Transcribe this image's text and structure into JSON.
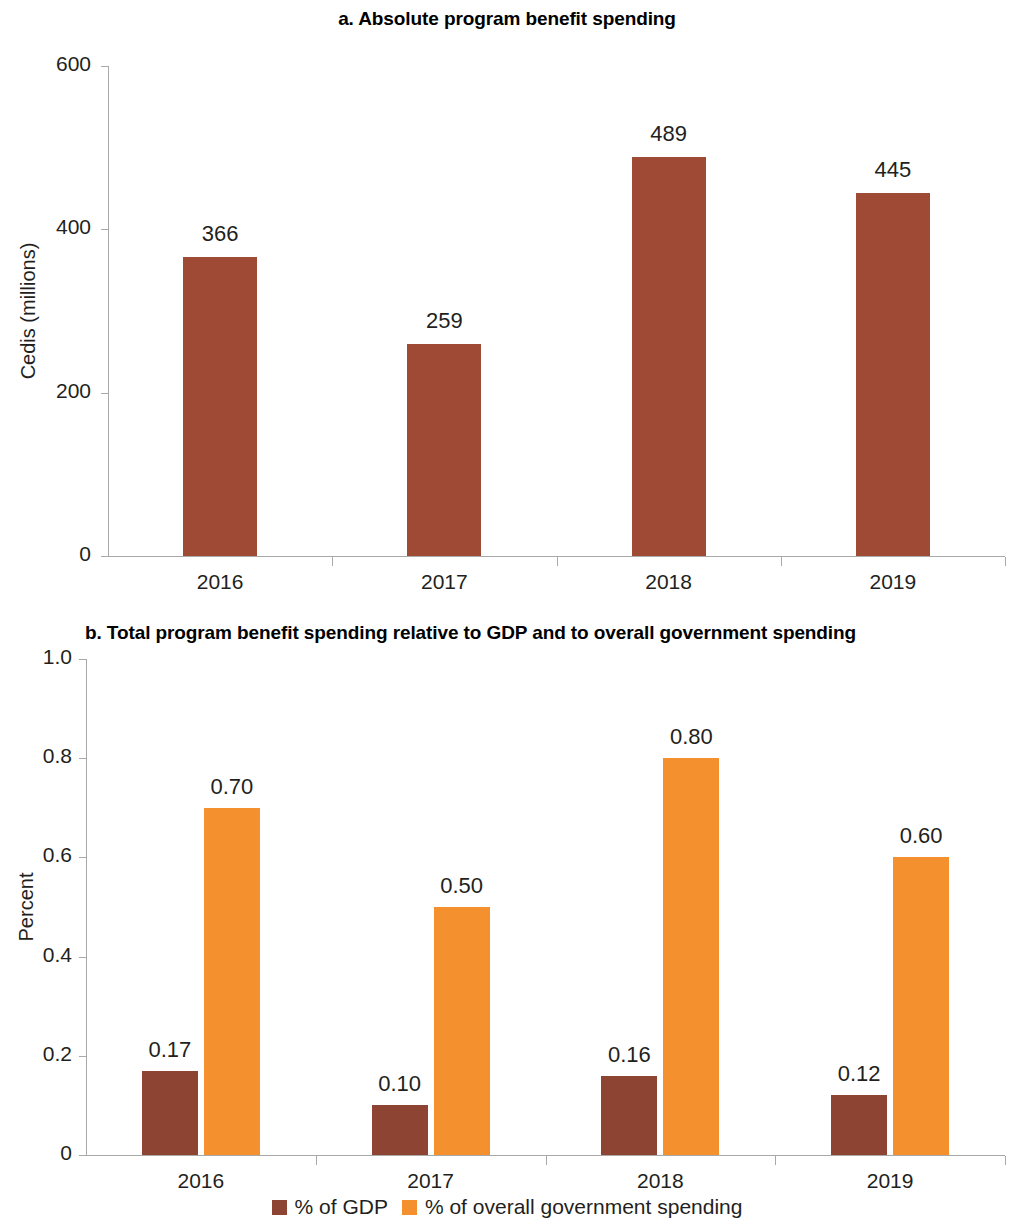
{
  "figure": {
    "panel_a_title": "a. Absolute program benefit spending",
    "panel_b_title": "b. Total program benefit spending relative to GDP and to overall government spending"
  },
  "colors": {
    "dark_brown": "#9e4a34",
    "dark_brown_b": "#8d4432",
    "orange": "#f4912e",
    "axis": "#a9a9a9",
    "text": "#231f20"
  },
  "legend": {
    "items": [
      {
        "label": "% of GDP",
        "color": "#8d4432"
      },
      {
        "label": "% of overall government spending",
        "color": "#f4912e"
      }
    ]
  },
  "chart_data": [
    {
      "type": "bar",
      "id": "panel-a",
      "title": "a. Absolute program benefit spending",
      "xlabel": "",
      "ylabel": "Cedis (millions)",
      "categories": [
        "2016",
        "2017",
        "2018",
        "2019"
      ],
      "values": [
        366,
        259,
        489,
        445
      ],
      "data_labels": [
        "366",
        "259",
        "489",
        "445"
      ],
      "ylim": [
        0,
        600
      ],
      "yticks": [
        0,
        200,
        400,
        600
      ],
      "ytick_labels": [
        "0",
        "200",
        "400",
        "600"
      ],
      "grid": false,
      "legend_position": "none",
      "series": [
        {
          "name": "Cedis (millions)",
          "color": "#9e4a34",
          "values": [
            366,
            259,
            489,
            445
          ]
        }
      ]
    },
    {
      "type": "bar",
      "id": "panel-b",
      "title": "b. Total program benefit spending relative to GDP and to overall government spending",
      "xlabel": "",
      "ylabel": "Percent",
      "categories": [
        "2016",
        "2017",
        "2018",
        "2019"
      ],
      "ylim": [
        0,
        1.0
      ],
      "yticks": [
        0,
        0.2,
        0.4,
        0.6,
        0.8,
        1.0
      ],
      "ytick_labels": [
        "0",
        "0.2",
        "0.4",
        "0.6",
        "0.8",
        "1.0"
      ],
      "grid": false,
      "legend_position": "bottom",
      "series": [
        {
          "name": "% of GDP",
          "color": "#8d4432",
          "values": [
            0.17,
            0.1,
            0.16,
            0.12
          ],
          "data_labels": [
            "0.17",
            "0.10",
            "0.16",
            "0.12"
          ]
        },
        {
          "name": "% of overall government spending",
          "color": "#f4912e",
          "values": [
            0.7,
            0.5,
            0.8,
            0.6
          ],
          "data_labels": [
            "0.70",
            "0.50",
            "0.80",
            "0.60"
          ]
        }
      ]
    }
  ]
}
